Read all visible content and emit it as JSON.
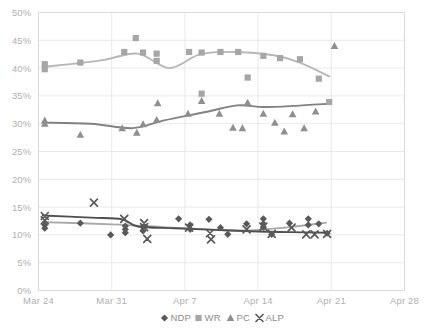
{
  "chart_data": {
    "type": "scatter",
    "title": "",
    "subtitle": "",
    "xlabel": "",
    "ylabel": "",
    "grid": true,
    "legend_position": "bottom",
    "xlim": [
      0,
      35
    ],
    "ylim": [
      0,
      50
    ],
    "x_tick_labels": [
      "Mar 24",
      "Mar 31",
      "Apr 7",
      "Apr 14",
      "Apr 21",
      "Apr 28"
    ],
    "x_tick_values": [
      0,
      7,
      14,
      21,
      28,
      35
    ],
    "y_tick_labels": [
      "0%",
      "5%",
      "10%",
      "15%",
      "20%",
      "25%",
      "30%",
      "35%",
      "40%",
      "45%",
      "50%"
    ],
    "y_tick_values": [
      0,
      5,
      10,
      15,
      20,
      25,
      30,
      35,
      40,
      45,
      50
    ],
    "series": [
      {
        "name": "NDP",
        "marker": "diamond",
        "color": "#595959",
        "trend_color": "#a8a8a8",
        "points": [
          {
            "x": 0.6,
            "y": 11.8
          },
          {
            "x": 0.6,
            "y": 11.2
          },
          {
            "x": 4.0,
            "y": 12.1
          },
          {
            "x": 6.9,
            "y": 10.0
          },
          {
            "x": 8.3,
            "y": 11.6
          },
          {
            "x": 8.3,
            "y": 11.0
          },
          {
            "x": 8.3,
            "y": 10.4
          },
          {
            "x": 10.0,
            "y": 11.4
          },
          {
            "x": 10.0,
            "y": 10.7
          },
          {
            "x": 13.4,
            "y": 12.9
          },
          {
            "x": 14.5,
            "y": 11.8
          },
          {
            "x": 14.5,
            "y": 11.0
          },
          {
            "x": 16.3,
            "y": 12.8
          },
          {
            "x": 17.4,
            "y": 11.3
          },
          {
            "x": 18.1,
            "y": 10.1
          },
          {
            "x": 19.9,
            "y": 12.0
          },
          {
            "x": 21.5,
            "y": 12.9
          },
          {
            "x": 21.5,
            "y": 12.0
          },
          {
            "x": 21.5,
            "y": 11.4
          },
          {
            "x": 22.3,
            "y": 10.1
          },
          {
            "x": 24.0,
            "y": 12.1
          },
          {
            "x": 25.8,
            "y": 12.9
          },
          {
            "x": 25.8,
            "y": 11.8
          },
          {
            "x": 26.8,
            "y": 12.0
          },
          {
            "x": 27.6,
            "y": 10.3
          }
        ],
        "trend": [
          {
            "x": 0.4,
            "y": 12.3
          },
          {
            "x": 7.0,
            "y": 11.9
          },
          {
            "x": 12.0,
            "y": 11.4
          },
          {
            "x": 17.0,
            "y": 10.9
          },
          {
            "x": 20.0,
            "y": 10.8
          },
          {
            "x": 24.0,
            "y": 11.4
          },
          {
            "x": 27.5,
            "y": 12.2
          }
        ]
      },
      {
        "name": "WR",
        "marker": "square",
        "color": "#a6a6a6",
        "trend_color": "#b7b7b7",
        "points": [
          {
            "x": 0.6,
            "y": 40.7
          },
          {
            "x": 0.6,
            "y": 39.8
          },
          {
            "x": 4.0,
            "y": 41.0
          },
          {
            "x": 8.2,
            "y": 42.9
          },
          {
            "x": 9.3,
            "y": 45.4
          },
          {
            "x": 10.0,
            "y": 42.8
          },
          {
            "x": 11.3,
            "y": 42.6
          },
          {
            "x": 11.3,
            "y": 41.3
          },
          {
            "x": 14.4,
            "y": 42.9
          },
          {
            "x": 15.6,
            "y": 42.8
          },
          {
            "x": 15.6,
            "y": 35.4
          },
          {
            "x": 17.4,
            "y": 42.9
          },
          {
            "x": 19.1,
            "y": 42.9
          },
          {
            "x": 20.0,
            "y": 38.3
          },
          {
            "x": 21.5,
            "y": 42.2
          },
          {
            "x": 23.1,
            "y": 41.8
          },
          {
            "x": 25.0,
            "y": 41.6
          },
          {
            "x": 26.8,
            "y": 38.1
          },
          {
            "x": 27.8,
            "y": 33.9
          }
        ],
        "trend": [
          {
            "x": 0.4,
            "y": 40.2
          },
          {
            "x": 6.0,
            "y": 41.4
          },
          {
            "x": 9.5,
            "y": 42.6
          },
          {
            "x": 12.5,
            "y": 40.0
          },
          {
            "x": 15.5,
            "y": 42.5
          },
          {
            "x": 19.0,
            "y": 42.9
          },
          {
            "x": 22.5,
            "y": 42.3
          },
          {
            "x": 25.0,
            "y": 41.0
          },
          {
            "x": 27.8,
            "y": 38.5
          }
        ]
      },
      {
        "name": "PC",
        "marker": "triangle",
        "color": "#8f8f8f",
        "trend_color": "#828282",
        "points": [
          {
            "x": 0.6,
            "y": 30.6
          },
          {
            "x": 0.6,
            "y": 30.0
          },
          {
            "x": 4.0,
            "y": 28.0
          },
          {
            "x": 8.0,
            "y": 29.2
          },
          {
            "x": 9.4,
            "y": 28.4
          },
          {
            "x": 10.0,
            "y": 29.9
          },
          {
            "x": 11.3,
            "y": 30.7
          },
          {
            "x": 11.4,
            "y": 33.7
          },
          {
            "x": 14.3,
            "y": 31.8
          },
          {
            "x": 15.6,
            "y": 34.1
          },
          {
            "x": 17.3,
            "y": 31.8
          },
          {
            "x": 18.6,
            "y": 29.3
          },
          {
            "x": 19.5,
            "y": 29.2
          },
          {
            "x": 20.0,
            "y": 33.8
          },
          {
            "x": 21.5,
            "y": 31.8
          },
          {
            "x": 22.6,
            "y": 30.2
          },
          {
            "x": 23.5,
            "y": 28.6
          },
          {
            "x": 24.3,
            "y": 31.7
          },
          {
            "x": 25.4,
            "y": 29.2
          },
          {
            "x": 26.5,
            "y": 32.2
          },
          {
            "x": 28.3,
            "y": 44.0
          }
        ],
        "trend": [
          {
            "x": 0.4,
            "y": 30.2
          },
          {
            "x": 5.0,
            "y": 30.0
          },
          {
            "x": 9.0,
            "y": 29.2
          },
          {
            "x": 12.0,
            "y": 30.6
          },
          {
            "x": 16.0,
            "y": 32.1
          },
          {
            "x": 19.0,
            "y": 33.3
          },
          {
            "x": 21.5,
            "y": 33.0
          },
          {
            "x": 24.5,
            "y": 33.2
          },
          {
            "x": 27.8,
            "y": 33.6
          }
        ]
      },
      {
        "name": "ALP",
        "marker": "x",
        "color": "#5a5a5a",
        "trend_color": "#4f4f4f",
        "points": [
          {
            "x": 0.6,
            "y": 13.4
          },
          {
            "x": 0.6,
            "y": 12.6
          },
          {
            "x": 5.3,
            "y": 15.8
          },
          {
            "x": 8.2,
            "y": 12.9
          },
          {
            "x": 10.1,
            "y": 12.1
          },
          {
            "x": 10.1,
            "y": 11.4
          },
          {
            "x": 10.4,
            "y": 9.3
          },
          {
            "x": 14.4,
            "y": 11.3
          },
          {
            "x": 16.4,
            "y": 10.3
          },
          {
            "x": 16.5,
            "y": 9.2
          },
          {
            "x": 19.9,
            "y": 11.0
          },
          {
            "x": 21.5,
            "y": 11.5
          },
          {
            "x": 22.3,
            "y": 10.2
          },
          {
            "x": 24.2,
            "y": 11.3
          },
          {
            "x": 25.6,
            "y": 10.1
          },
          {
            "x": 26.4,
            "y": 10.1
          },
          {
            "x": 27.6,
            "y": 10.2
          }
        ],
        "trend": [
          {
            "x": 0.4,
            "y": 13.5
          },
          {
            "x": 5.0,
            "y": 13.1
          },
          {
            "x": 8.0,
            "y": 12.8
          },
          {
            "x": 9.5,
            "y": 11.5
          },
          {
            "x": 13.0,
            "y": 11.2
          },
          {
            "x": 17.0,
            "y": 10.9
          },
          {
            "x": 21.0,
            "y": 10.6
          },
          {
            "x": 24.0,
            "y": 10.5
          },
          {
            "x": 27.8,
            "y": 10.4
          }
        ]
      }
    ]
  },
  "legend": {
    "items": [
      {
        "label": "NDP",
        "marker": "diamond",
        "color": "#595959"
      },
      {
        "label": "WR",
        "marker": "square",
        "color": "#a6a6a6"
      },
      {
        "label": "PC",
        "marker": "triangle",
        "color": "#8f8f8f"
      },
      {
        "label": "ALP",
        "marker": "x",
        "color": "#5a5a5a"
      }
    ]
  },
  "colors": {
    "grid": "#e3e3e3",
    "axis": "#d8d8d8",
    "tick_text": "#b0b0b0",
    "legend_text": "#8d8d8d",
    "background": "#ffffff"
  }
}
